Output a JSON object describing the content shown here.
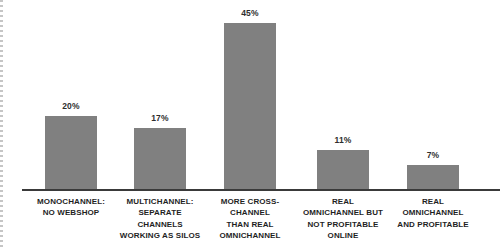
{
  "chart_data": {
    "type": "bar",
    "title": "",
    "subtitle": "",
    "xlabel": "",
    "ylabel": "",
    "ylim": [
      0,
      45
    ],
    "grid": false,
    "legend": false,
    "bar_color": "#808080",
    "axis_color": "#3a3a3a",
    "background": "#ffffff",
    "value_suffix": "%",
    "categories": [
      "MONOCHANNEL: NO WEBSHOP",
      "MULTICHANNEL: SEPARATE CHANNELS WORKING AS SILOS",
      "MORE CROSS-CHANNEL THAN REAL OMNICHANNEL",
      "REAL OMNICHANNEL BUT NOT PROFITABLE ONLINE",
      "REAL OMNICHANNEL AND PROFITABLE"
    ],
    "values": [
      20,
      17,
      45,
      11,
      7
    ],
    "bars": [
      {
        "value": 20,
        "value_label": "20%",
        "category_lines": [
          "MONOCHANNEL:",
          "NO WEBSHOP"
        ]
      },
      {
        "value": 17,
        "value_label": "17%",
        "category_lines": [
          "MULTICHANNEL:",
          "SEPARATE",
          "CHANNELS",
          "WORKING AS SILOS"
        ]
      },
      {
        "value": 45,
        "value_label": "45%",
        "category_lines": [
          "MORE CROSS-",
          "CHANNEL",
          "THAN REAL",
          "OMNICHANNEL"
        ]
      },
      {
        "value": 11,
        "value_label": "11%",
        "category_lines": [
          "REAL",
          "OMNICHANNEL BUT",
          "NOT PROFITABLE",
          "ONLINE"
        ]
      },
      {
        "value": 7,
        "value_label": "7%",
        "category_lines": [
          "REAL",
          "OMNICHANNEL",
          "AND PROFITABLE"
        ]
      }
    ]
  }
}
